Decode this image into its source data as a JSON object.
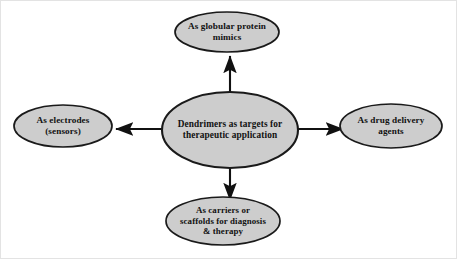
{
  "diagram": {
    "type": "radial-hub-and-spoke",
    "title": "Dendrimers as targets for therapeutic application",
    "frame_color": "#e3e3e3",
    "node_fill": "#cdcdcd",
    "node_stroke": "#1a1a1a",
    "arrow_color": "#111111",
    "text_color": "#111111",
    "background": "#ffffff",
    "center": {
      "id": "center",
      "label": "Dendrimers as targets for therapeutic application",
      "lines": [
        "Dendrimers as targets for",
        "therapeutic application"
      ],
      "cx": 230,
      "cy": 130,
      "rx": 68,
      "ry": 38
    },
    "nodes": [
      {
        "id": "top",
        "label": "As globular protein mimics",
        "lines": [
          "As globular protein",
          "mimics"
        ],
        "cx": 227,
        "cy": 32,
        "rx": 52,
        "ry": 20,
        "direction": "up"
      },
      {
        "id": "left",
        "label": "As electrodes (sensors)",
        "lines": [
          "As electrodes",
          "(sensors)"
        ],
        "cx": 63,
        "cy": 126,
        "rx": 49,
        "ry": 21,
        "direction": "left"
      },
      {
        "id": "right",
        "label": "As drug delivery agents",
        "lines": [
          "As drug delivery",
          "agents"
        ],
        "cx": 391,
        "cy": 126,
        "rx": 51,
        "ry": 22,
        "direction": "right"
      },
      {
        "id": "bottom",
        "label": "As carriers or scaffolds for diagnosis & therapy",
        "lines": [
          "As carriers or",
          "scaffolds for diagnosis",
          "& therapy"
        ],
        "cx": 223,
        "cy": 221,
        "rx": 57,
        "ry": 24,
        "direction": "down"
      }
    ],
    "connectors": [
      {
        "id": "connector-up",
        "from": "center",
        "to": "top",
        "arrowhead": "end"
      },
      {
        "id": "connector-left",
        "from": "center",
        "to": "left",
        "arrowhead": "end"
      },
      {
        "id": "connector-right",
        "from": "center",
        "to": "right",
        "arrowhead": "end"
      },
      {
        "id": "connector-down",
        "from": "center",
        "to": "bottom",
        "arrowhead": "end"
      }
    ]
  }
}
